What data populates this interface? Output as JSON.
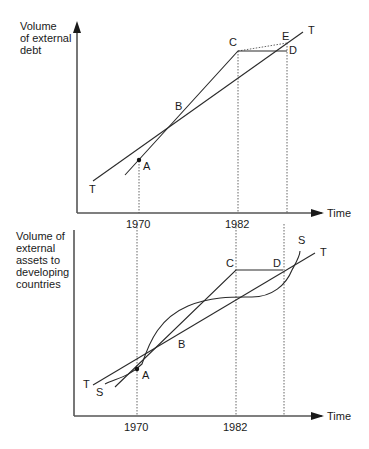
{
  "top_panel": {
    "y_axis_label_lines": [
      "Volume",
      "of external",
      "debt"
    ],
    "x_axis_label": "Time",
    "ticks": [
      "1970",
      "1982"
    ],
    "points": {
      "A": "A",
      "B": "B",
      "C": "C",
      "D": "D",
      "E": "E",
      "T_start": "T",
      "T_end": "T"
    }
  },
  "bottom_panel": {
    "y_axis_label_lines": [
      "Volume of",
      "external",
      "assets to",
      "developing",
      "countries"
    ],
    "x_axis_label": "Time",
    "ticks": [
      "1970",
      "1982"
    ],
    "points": {
      "A": "A",
      "B": "B",
      "C": "C",
      "D": "D",
      "T_start": "T",
      "T_end": "T",
      "S_start": "S",
      "S_end": "S"
    }
  },
  "colors": {
    "line": "#2a2a2a",
    "dotted": "#555555"
  }
}
